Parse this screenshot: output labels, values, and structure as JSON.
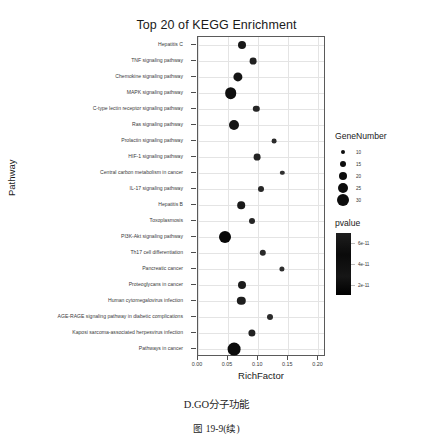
{
  "chart_data": {
    "type": "scatter",
    "title": "Top 20 of KEGG Enrichment",
    "xlabel": "RichFactor",
    "ylabel": "Pathway",
    "xlim": [
      0.0,
      0.2125
    ],
    "xticks": [
      0.0,
      0.05,
      0.1,
      0.15,
      0.2
    ],
    "xticklabels": [
      "0.00",
      "0.05",
      "0.10",
      "0.15",
      "0.20"
    ],
    "grid": true,
    "legend_position": "right",
    "categories": [
      "Hepatitis C",
      "TNF signaling pathway",
      "Chemokine signaling pathway",
      "MAPK signaling pathway",
      "C-type lectin receptor signaling pathway",
      "Ras signaling pathway",
      "Prolactin signaling pathway",
      "HIF-1 signaling pathway",
      "Central carbon metabolism in cancer",
      "IL-17 signaling pathway",
      "Hepatitis B",
      "Toxoplasmosis",
      "PI3K-Akt signaling pathway",
      "Th17 cell differentiation",
      "Pancreatic cancer",
      "Proteoglycans in cancer",
      "Human cytomegalovirus infection",
      "AGE-RAGE signaling pathway in diabetic complications",
      "Kaposi sarcoma-associated herpesvirus infection",
      "Pathways in cancer"
    ],
    "points": [
      {
        "pathway": "Hepatitis C",
        "richfactor": 0.073,
        "gene_number": 18,
        "pvalue": 2.9e-11
      },
      {
        "pathway": "TNF signaling pathway",
        "richfactor": 0.091,
        "gene_number": 15,
        "pvalue": 2.4e-11
      },
      {
        "pathway": "Chemokine signaling pathway",
        "richfactor": 0.066,
        "gene_number": 21,
        "pvalue": 3.1e-11
      },
      {
        "pathway": "MAPK signaling pathway",
        "richfactor": 0.054,
        "gene_number": 27,
        "pvalue": 3.4e-11
      },
      {
        "pathway": "C-type lectin receptor signaling pathway",
        "richfactor": 0.097,
        "gene_number": 14,
        "pvalue": 2.2e-11
      },
      {
        "pathway": "Ras signaling pathway",
        "richfactor": 0.059,
        "gene_number": 23,
        "pvalue": 3.2e-11
      },
      {
        "pathway": "Prolactin signaling pathway",
        "richfactor": 0.126,
        "gene_number": 10,
        "pvalue": 1.8e-11
      },
      {
        "pathway": "HIF-1 signaling pathway",
        "richfactor": 0.098,
        "gene_number": 15,
        "pvalue": 2.3e-11
      },
      {
        "pathway": "Central carbon metabolism in cancer",
        "richfactor": 0.14,
        "gene_number": 9,
        "pvalue": 1.6e-11
      },
      {
        "pathway": "IL-17 signaling pathway",
        "richfactor": 0.105,
        "gene_number": 13,
        "pvalue": 2.1e-11
      },
      {
        "pathway": "Hepatitis B",
        "richfactor": 0.072,
        "gene_number": 17,
        "pvalue": 2.8e-11
      },
      {
        "pathway": "Toxoplasmosis",
        "richfactor": 0.09,
        "gene_number": 13,
        "pvalue": 2.2e-11
      },
      {
        "pathway": "PI3K-Akt signaling pathway",
        "richfactor": 0.045,
        "gene_number": 28,
        "pvalue": 3.8e-11
      },
      {
        "pathway": "Th17 cell differentiation",
        "richfactor": 0.108,
        "gene_number": 14,
        "pvalue": 2e-11
      },
      {
        "pathway": "Pancreatic cancer",
        "richfactor": 0.139,
        "gene_number": 11,
        "pvalue": 1.7e-11
      },
      {
        "pathway": "Proteoglycans in cancer",
        "richfactor": 0.073,
        "gene_number": 18,
        "pvalue": 2.7e-11
      },
      {
        "pathway": "Human cytomegalovirus infection",
        "richfactor": 0.072,
        "gene_number": 19,
        "pvalue": 2.6e-11
      },
      {
        "pathway": "AGE-RAGE signaling pathway in diabetic complications",
        "richfactor": 0.119,
        "gene_number": 13,
        "pvalue": 1.9e-11
      },
      {
        "pathway": "Kaposi sarcoma-associated herpesvirus infection",
        "richfactor": 0.09,
        "gene_number": 16,
        "pvalue": 2.4e-11
      },
      {
        "pathway": "Pathways in cancer",
        "richfactor": 0.06,
        "gene_number": 30,
        "pvalue": 3.6e-11
      }
    ],
    "legends": {
      "size": {
        "title": "GeneNumber",
        "entries": [
          {
            "label": "10",
            "px": 2.4
          },
          {
            "label": "15",
            "px": 3.4
          },
          {
            "label": "20",
            "px": 4.4
          },
          {
            "label": "25",
            "px": 5.2
          },
          {
            "label": "30",
            "px": 6.2
          }
        ]
      },
      "color": {
        "title": "pvalue",
        "ticklabels": [
          "6e-11",
          "4e-11",
          "2e-11"
        ],
        "tickpos": [
          0.16,
          0.5,
          0.84
        ],
        "gradient_top": "#1e1e1e",
        "gradient_bottom": "#000000"
      }
    }
  },
  "captions": {
    "panel_label": "D.GO分子功能",
    "figure_number": "图 19-9(续)"
  }
}
